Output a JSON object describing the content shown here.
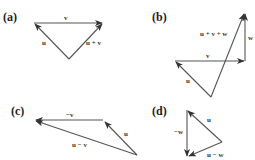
{
  "figure": {
    "panels": [
      {
        "id": "a",
        "label": "(a)",
        "vectors": [
          {
            "name": "v",
            "label": "v",
            "from": [
              34,
              23
            ],
            "to": [
              102,
              23
            ]
          },
          {
            "name": "u",
            "label": "u",
            "from": [
              69,
              59
            ],
            "to": [
              34,
              23
            ]
          },
          {
            "name": "u+v",
            "label": "u + v",
            "from": [
              69,
              59
            ],
            "to": [
              102,
              23
            ]
          }
        ]
      },
      {
        "id": "b",
        "label": "(b)",
        "vectors": [
          {
            "name": "v",
            "label": "v",
            "from": [
              175,
              61
            ],
            "to": [
              244,
              61
            ]
          },
          {
            "name": "w",
            "label": "w",
            "from": [
              245,
              61
            ],
            "to": [
              245,
              13
            ]
          },
          {
            "name": "u",
            "label": "u",
            "from": [
              211,
              97
            ],
            "to": [
              175,
              61
            ]
          },
          {
            "name": "u+v+w",
            "label": "u + v + w",
            "from": [
              211,
              97
            ],
            "to": [
              245,
              13
            ]
          }
        ]
      },
      {
        "id": "c",
        "label": "(c)",
        "vectors": [
          {
            "name": "-v",
            "label": "−v",
            "from": [
              103,
              120
            ],
            "to": [
              35,
              120
            ]
          },
          {
            "name": "u",
            "label": "u",
            "from": [
              137,
              155
            ],
            "to": [
              104,
              121
            ]
          },
          {
            "name": "u-v",
            "label": "u − v",
            "from": [
              137,
              155
            ],
            "to": [
              35,
              120
            ]
          }
        ]
      },
      {
        "id": "d",
        "label": "(d)",
        "vectors": [
          {
            "name": "u",
            "label": "u",
            "from": [
              222,
              142
            ],
            "to": [
              187,
              110
            ]
          },
          {
            "name": "-w",
            "label": "−w",
            "from": [
              187,
              110
            ],
            "to": [
              187,
              157
            ]
          },
          {
            "name": "u-w",
            "label": "u − w",
            "from": [
              222,
              142
            ],
            "to": [
              188,
              157
            ]
          }
        ]
      }
    ]
  },
  "colors": {
    "line": "#555555",
    "text": "#222222",
    "background": "#ffffff"
  }
}
